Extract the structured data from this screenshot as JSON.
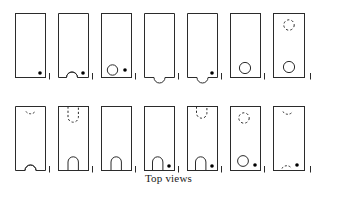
{
  "figure": {
    "caption": "Top views",
    "rows": 2,
    "columns": 7,
    "total_views": 14,
    "stroke_color": "#2b2b2b",
    "dot_color": "#000000",
    "background_color": "#ffffff",
    "views": [
      {
        "id": "view-1",
        "row": 1,
        "column": 1,
        "outline": "rectangle",
        "features": [
          "corner-dot-bottom-right"
        ],
        "top_feature": "none",
        "bottom_feature": "none",
        "has_dot": true,
        "tick_mark": true
      },
      {
        "id": "view-2",
        "row": 1,
        "column": 2,
        "outline": "rectangle",
        "features": [
          "bottom-arc-bump",
          "corner-dot-bottom-right"
        ],
        "top_feature": "none",
        "bottom_feature": "solid-arc-bump",
        "has_dot": true,
        "tick_mark": true
      },
      {
        "id": "view-3",
        "row": 1,
        "column": 3,
        "outline": "rectangle",
        "features": [
          "circle-bottom-left",
          "corner-dot-bottom-right"
        ],
        "top_feature": "none",
        "bottom_feature": "solid-circle",
        "has_dot": true,
        "tick_mark": true
      },
      {
        "id": "view-4",
        "row": 1,
        "column": 4,
        "outline": "rectangle",
        "features": [
          "bottom-notch-concave"
        ],
        "top_feature": "none",
        "bottom_feature": "concave-notch",
        "has_dot": false,
        "tick_mark": true
      },
      {
        "id": "view-5",
        "row": 1,
        "column": 5,
        "outline": "rectangle",
        "features": [
          "bottom-notch-concave",
          "corner-dot-bottom-right"
        ],
        "top_feature": "none",
        "bottom_feature": "concave-notch",
        "has_dot": true,
        "tick_mark": true
      },
      {
        "id": "view-6",
        "row": 1,
        "column": 6,
        "outline": "rectangle",
        "features": [
          "circle-bottom-center"
        ],
        "top_feature": "none",
        "bottom_feature": "solid-circle",
        "has_dot": false,
        "tick_mark": true
      },
      {
        "id": "view-7",
        "row": 1,
        "column": 7,
        "outline": "rectangle",
        "features": [
          "dashed-circle-top",
          "circle-bottom-center"
        ],
        "top_feature": "dashed-circle",
        "bottom_feature": "solid-circle",
        "has_dot": false,
        "tick_mark": true
      },
      {
        "id": "view-8",
        "row": 2,
        "column": 1,
        "outline": "rectangle",
        "features": [
          "dashed-arc-top",
          "bottom-arc-bump"
        ],
        "top_feature": "dashed-shallow-arc",
        "bottom_feature": "solid-shallow-arc",
        "has_dot": false,
        "tick_mark": true
      },
      {
        "id": "view-9",
        "row": 2,
        "column": 2,
        "outline": "rectangle",
        "features": [
          "dashed-slot-top",
          "solid-slot-bottom"
        ],
        "top_feature": "dashed-u-slot",
        "bottom_feature": "solid-u-slot",
        "has_dot": false,
        "tick_mark": true
      },
      {
        "id": "view-10",
        "row": 2,
        "column": 3,
        "outline": "rectangle",
        "features": [
          "solid-slot-bottom"
        ],
        "top_feature": "none",
        "bottom_feature": "solid-u-slot",
        "has_dot": false,
        "tick_mark": true
      },
      {
        "id": "view-11",
        "row": 2,
        "column": 4,
        "outline": "rectangle",
        "features": [
          "solid-slot-bottom",
          "corner-dot-bottom-right"
        ],
        "top_feature": "none",
        "bottom_feature": "solid-u-slot",
        "has_dot": true,
        "tick_mark": true
      },
      {
        "id": "view-12",
        "row": 2,
        "column": 5,
        "outline": "rectangle",
        "features": [
          "dashed-arc-top",
          "solid-slot-bottom",
          "corner-dot-bottom-right"
        ],
        "top_feature": "dashed-u-arc",
        "bottom_feature": "solid-u-slot",
        "has_dot": true,
        "tick_mark": true
      },
      {
        "id": "view-13",
        "row": 2,
        "column": 6,
        "outline": "rectangle",
        "features": [
          "dashed-circle-top",
          "circle-bottom-left",
          "corner-dot-bottom-right"
        ],
        "top_feature": "dashed-circle",
        "bottom_feature": "solid-circle",
        "has_dot": true,
        "tick_mark": true
      },
      {
        "id": "view-14",
        "row": 2,
        "column": 7,
        "outline": "rectangle",
        "features": [
          "dashed-arc-top",
          "dashed-arc-bottom",
          "corner-dot-bottom-right"
        ],
        "top_feature": "dashed-shallow-arc",
        "bottom_feature": "dashed-shallow-arc",
        "has_dot": true,
        "tick_mark": true
      }
    ]
  }
}
